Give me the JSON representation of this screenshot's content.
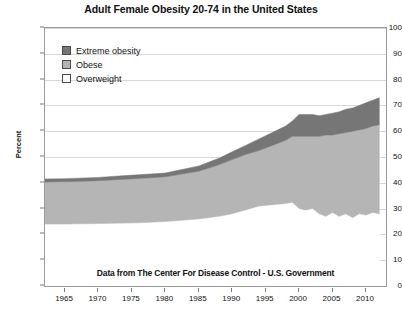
{
  "chart_data": {
    "type": "area",
    "title": "Adult Female Obesity 20-74 in the United States",
    "xlabel": "",
    "ylabel": "Percent",
    "xlim": [
      1962,
      2013
    ],
    "ylim": [
      0,
      100
    ],
    "grid": true,
    "stacked": true,
    "legend_position": "top-left-inside",
    "annotation": "Data from The Center For Disease Control - U.S. Government",
    "xticks": [
      1965,
      1970,
      1975,
      1980,
      1985,
      1990,
      1995,
      2000,
      2005,
      2010
    ],
    "yticks": [
      0,
      10,
      20,
      30,
      40,
      50,
      60,
      70,
      80,
      90,
      100
    ],
    "x": [
      1962,
      1965,
      1970,
      1974,
      1976,
      1980,
      1985,
      1988,
      1990,
      1992,
      1994,
      1996,
      1998,
      1999,
      2000,
      2001,
      2002,
      2003,
      2004,
      2005,
      2006,
      2007,
      2008,
      2009,
      2010,
      2011,
      2012
    ],
    "series": [
      {
        "name": "Overweight",
        "color": "#ffffff",
        "values": [
          24.0,
          24.0,
          24.2,
          24.4,
          24.5,
          25.0,
          26.0,
          27.0,
          28.0,
          29.5,
          31.0,
          31.5,
          32.0,
          32.5,
          30.0,
          29.5,
          30.0,
          28.0,
          27.0,
          28.5,
          27.0,
          28.0,
          26.5,
          28.0,
          27.5,
          28.5,
          28.0
        ]
      },
      {
        "name": "Obese",
        "color": "#b5b5b5",
        "values": [
          16.3,
          16.4,
          16.6,
          17.0,
          17.2,
          17.3,
          18.5,
          20.0,
          21.0,
          21.5,
          21.5,
          23.0,
          24.5,
          25.5,
          28.0,
          28.5,
          28.0,
          30.0,
          31.5,
          30.0,
          32.0,
          31.5,
          33.5,
          32.5,
          33.5,
          33.5,
          34.5
        ]
      },
      {
        "name": "Extreme obesity",
        "color": "#767676",
        "values": [
          1.2,
          1.2,
          1.3,
          1.4,
          1.4,
          1.5,
          2.0,
          2.5,
          3.0,
          3.5,
          4.5,
          5.0,
          5.5,
          6.0,
          8.5,
          8.5,
          8.5,
          8.0,
          8.0,
          8.5,
          8.5,
          9.0,
          9.0,
          9.5,
          10.0,
          10.0,
          10.5
        ]
      }
    ],
    "cumulative_top": [
      41.5,
      41.6,
      42.1,
      42.8,
      43.1,
      43.8,
      46.5,
      49.5,
      52.0,
      54.5,
      57.0,
      59.5,
      62.0,
      64.0,
      66.5,
      66.5,
      66.5,
      66.0,
      66.5,
      67.0,
      67.5,
      68.5,
      69.0,
      70.0,
      71.0,
      72.0,
      73.0
    ]
  },
  "legend": {
    "items": [
      {
        "label": "Extreme obesity",
        "color": "#767676"
      },
      {
        "label": "Obese",
        "color": "#b5b5b5"
      },
      {
        "label": "Overweight",
        "color": "#ffffff"
      }
    ]
  },
  "colors": {
    "extreme_obesity": "#767676",
    "obese": "#b5b5b5",
    "overweight": "#ffffff",
    "grid": "#d8d8d8",
    "frame": "#9a9a9a",
    "text": "#111111"
  }
}
